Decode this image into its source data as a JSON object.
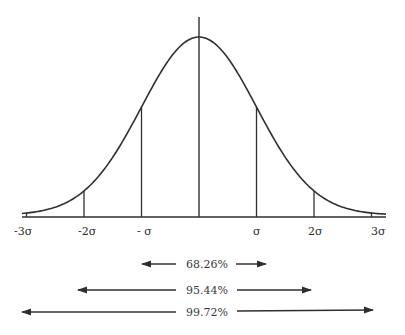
{
  "diagram": {
    "title": "",
    "type": "normal-distribution-curve",
    "stroke_color": "#2f2f2f",
    "background": "#ffffff"
  },
  "axis": {
    "ticks": [
      {
        "label": "-3σ",
        "sigma": -3
      },
      {
        "label": "-2σ",
        "sigma": -2
      },
      {
        "label": "- σ",
        "sigma": -1
      },
      {
        "label": "σ",
        "sigma": 1
      },
      {
        "label": "2σ",
        "sigma": 2
      },
      {
        "label": "3σ",
        "sigma": 3
      }
    ]
  },
  "ranges": [
    {
      "label": "68.26%",
      "from_sigma": -1,
      "to_sigma": 1
    },
    {
      "label": "95.44%",
      "from_sigma": -2,
      "to_sigma": 2
    },
    {
      "label": "99.72%",
      "from_sigma": -3,
      "to_sigma": 3
    }
  ]
}
